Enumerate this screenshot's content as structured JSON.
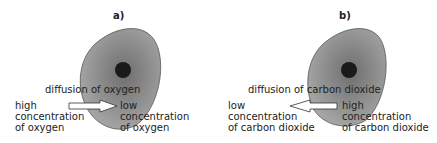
{
  "panels": [
    {
      "id": "a",
      "title": "a)",
      "process_label": "diffusion of oxygen",
      "left_label": [
        "high",
        "concentration",
        "of oxygen"
      ],
      "right_label": [
        "low",
        "concentration",
        "of oxygen"
      ],
      "arrow_direction": "right"
    },
    {
      "id": "b",
      "title": "b)",
      "process_label": "diffusion of carbon dioxide",
      "left_label": [
        "low",
        "concentration",
        "of carbon dioxide"
      ],
      "right_label": [
        "high",
        "concentration",
        "of carbon dioxide"
      ],
      "arrow_direction": "left"
    }
  ],
  "colors": {
    "cell_fill": "#9a9a9a",
    "cell_center": "#6e6e6e",
    "nucleus": "#1a1a1a",
    "text": "#222222"
  }
}
